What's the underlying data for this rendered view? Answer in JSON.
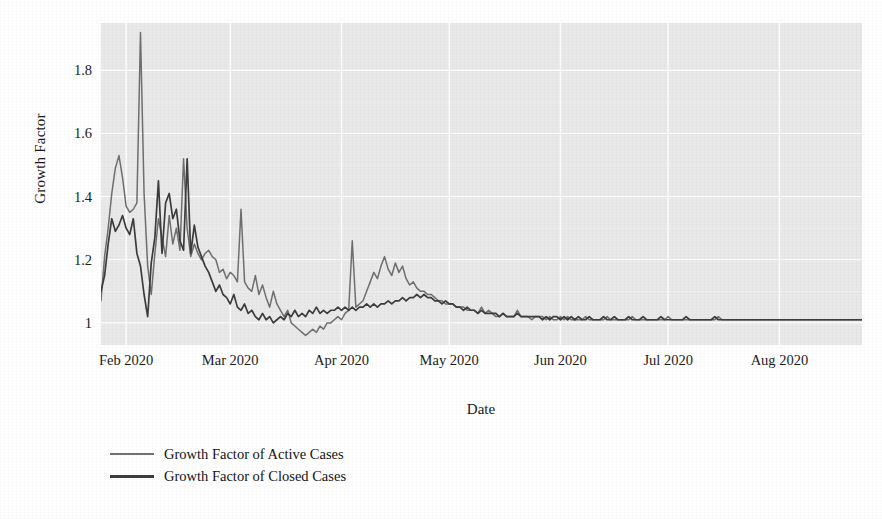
{
  "chart_data": {
    "type": "line",
    "title": "",
    "xlabel": "Date",
    "ylabel": "Growth Factor",
    "grid": true,
    "legend_position": "below-left",
    "xlim": [
      "2020-01-25",
      "2020-08-28"
    ],
    "ylim": [
      0.93,
      1.95
    ],
    "yticks": [
      "1",
      "1.2",
      "1.4",
      "1.6",
      "1.8"
    ],
    "ytick_values": [
      1,
      1.2,
      1.4,
      1.6,
      1.8
    ],
    "xticks": [
      "Feb 2020",
      "Mar 2020",
      "Apr 2020",
      "May 2020",
      "Jun 2020",
      "Jul 2020",
      "Aug 2020"
    ],
    "xtick_days": [
      7,
      36,
      67,
      97,
      128,
      158,
      189
    ],
    "colors": {
      "series_0": "#6f6f6f",
      "series_1": "#3d3d3d",
      "panel_background": "#e9e9e9",
      "gridline": "#ffffff",
      "text": "#1a1a1a"
    },
    "series": [
      {
        "name": "Growth Factor of Active Cases",
        "color": "#6f6f6f",
        "values": [
          1.07,
          1.21,
          1.3,
          1.41,
          1.49,
          1.53,
          1.46,
          1.37,
          1.35,
          1.36,
          1.38,
          1.92,
          1.41,
          1.18,
          1.09,
          1.22,
          1.33,
          1.27,
          1.21,
          1.34,
          1.25,
          1.3,
          1.23,
          1.52,
          1.3,
          1.21,
          1.25,
          1.22,
          1.2,
          1.22,
          1.23,
          1.21,
          1.2,
          1.16,
          1.17,
          1.14,
          1.16,
          1.15,
          1.13,
          1.36,
          1.13,
          1.11,
          1.1,
          1.15,
          1.09,
          1.12,
          1.08,
          1.05,
          1.1,
          1.06,
          1.04,
          1.02,
          1.04,
          1.0,
          0.99,
          0.98,
          0.97,
          0.96,
          0.97,
          0.98,
          0.97,
          0.99,
          0.98,
          1.0,
          1.0,
          1.01,
          1.02,
          1.01,
          1.03,
          1.04,
          1.26,
          1.05,
          1.06,
          1.07,
          1.1,
          1.13,
          1.16,
          1.14,
          1.18,
          1.21,
          1.17,
          1.15,
          1.19,
          1.16,
          1.18,
          1.14,
          1.12,
          1.13,
          1.11,
          1.1,
          1.1,
          1.09,
          1.09,
          1.08,
          1.07,
          1.07,
          1.06,
          1.06,
          1.06,
          1.05,
          1.05,
          1.05,
          1.04,
          1.04,
          1.04,
          1.03,
          1.05,
          1.03,
          1.04,
          1.03,
          1.02,
          1.02,
          1.03,
          1.02,
          1.02,
          1.02,
          1.04,
          1.02,
          1.02,
          1.02,
          1.01,
          1.02,
          1.02,
          1.02,
          1.01,
          1.02,
          1.01,
          1.01,
          1.02,
          1.01,
          1.02,
          1.01,
          1.01,
          1.01,
          1.01,
          1.02,
          1.01,
          1.01,
          1.01,
          1.01,
          1.01,
          1.02,
          1.01,
          1.01,
          1.01,
          1.01,
          1.01,
          1.01,
          1.02,
          1.01,
          1.01,
          1.01,
          1.01,
          1.01,
          1.01,
          1.01,
          1.01,
          1.01,
          1.02,
          1.01,
          1.01,
          1.01,
          1.01,
          1.01,
          1.01,
          1.01,
          1.01,
          1.01,
          1.01,
          1.01,
          1.01,
          1.01,
          1.02,
          1.01,
          1.01,
          1.01,
          1.01,
          1.01,
          1.01,
          1.01,
          1.01,
          1.01,
          1.01,
          1.01,
          1.01,
          1.01,
          1.01,
          1.01,
          1.01,
          1.01,
          1.01,
          1.01,
          1.01,
          1.01,
          1.01,
          1.01,
          1.01,
          1.01,
          1.01,
          1.01,
          1.01,
          1.01,
          1.01,
          1.01,
          1.01,
          1.01,
          1.01,
          1.01,
          1.01,
          1.01,
          1.01,
          1.01,
          1.01
        ]
      },
      {
        "name": "Growth Factor of Closed Cases",
        "color": "#3d3d3d",
        "values": [
          1.1,
          1.15,
          1.25,
          1.33,
          1.29,
          1.31,
          1.34,
          1.3,
          1.28,
          1.33,
          1.22,
          1.18,
          1.09,
          1.02,
          1.19,
          1.27,
          1.45,
          1.22,
          1.38,
          1.41,
          1.33,
          1.36,
          1.26,
          1.23,
          1.52,
          1.22,
          1.31,
          1.24,
          1.21,
          1.18,
          1.16,
          1.13,
          1.1,
          1.12,
          1.09,
          1.08,
          1.06,
          1.09,
          1.05,
          1.04,
          1.06,
          1.03,
          1.04,
          1.02,
          1.01,
          1.03,
          1.01,
          1.02,
          1.0,
          1.01,
          1.02,
          1.01,
          1.03,
          1.02,
          1.04,
          1.02,
          1.03,
          1.02,
          1.04,
          1.03,
          1.05,
          1.03,
          1.04,
          1.03,
          1.04,
          1.04,
          1.05,
          1.04,
          1.05,
          1.04,
          1.05,
          1.04,
          1.05,
          1.05,
          1.06,
          1.05,
          1.06,
          1.05,
          1.06,
          1.06,
          1.07,
          1.06,
          1.07,
          1.07,
          1.08,
          1.07,
          1.08,
          1.08,
          1.09,
          1.08,
          1.09,
          1.08,
          1.08,
          1.07,
          1.07,
          1.06,
          1.07,
          1.06,
          1.06,
          1.05,
          1.05,
          1.04,
          1.05,
          1.04,
          1.04,
          1.03,
          1.04,
          1.03,
          1.03,
          1.03,
          1.03,
          1.02,
          1.03,
          1.02,
          1.02,
          1.02,
          1.03,
          1.02,
          1.02,
          1.02,
          1.02,
          1.02,
          1.02,
          1.01,
          1.02,
          1.01,
          1.02,
          1.02,
          1.01,
          1.02,
          1.01,
          1.02,
          1.01,
          1.02,
          1.01,
          1.01,
          1.02,
          1.01,
          1.01,
          1.01,
          1.02,
          1.01,
          1.01,
          1.02,
          1.01,
          1.01,
          1.01,
          1.02,
          1.01,
          1.01,
          1.01,
          1.02,
          1.01,
          1.01,
          1.01,
          1.01,
          1.02,
          1.01,
          1.01,
          1.01,
          1.01,
          1.01,
          1.01,
          1.02,
          1.01,
          1.01,
          1.01,
          1.01,
          1.01,
          1.01,
          1.01,
          1.02,
          1.01,
          1.01,
          1.01,
          1.01,
          1.01,
          1.01,
          1.01,
          1.01,
          1.01,
          1.01,
          1.01,
          1.01,
          1.01,
          1.01,
          1.01,
          1.01,
          1.01,
          1.01,
          1.01,
          1.01,
          1.01,
          1.01,
          1.01,
          1.01,
          1.01,
          1.01,
          1.01,
          1.01,
          1.01,
          1.01,
          1.01,
          1.01,
          1.01,
          1.01,
          1.01,
          1.01,
          1.01,
          1.01,
          1.01,
          1.01,
          1.01
        ]
      }
    ]
  },
  "legend": {
    "entries": [
      {
        "label": "Growth Factor of Active Cases"
      },
      {
        "label": "Growth Factor of Closed Cases"
      }
    ]
  },
  "axis": {
    "x_title": "Date",
    "y_title": "Growth Factor"
  }
}
